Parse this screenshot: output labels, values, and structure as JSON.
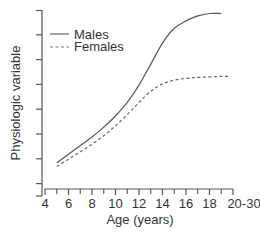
{
  "chart_data": {
    "type": "line",
    "title": "",
    "xlabel": "Age (years)",
    "ylabel": "Physiologic variable",
    "x_ticks": [
      "4",
      "6",
      "8",
      "10",
      "12",
      "14",
      "16",
      "18",
      "20-30"
    ],
    "x_tick_positions": [
      4,
      6,
      8,
      10,
      12,
      14,
      16,
      18,
      20
    ],
    "x_minor_ticks": [
      5,
      7,
      9,
      11,
      13,
      15,
      17,
      19
    ],
    "y_ticks_count": 8,
    "y_tick_labels": [],
    "xlim": [
      4,
      20
    ],
    "ylim": [
      0,
      7.5
    ],
    "grid": false,
    "legend_position": "upper-left",
    "series": [
      {
        "name": "Males",
        "style": "solid",
        "color": "#555555",
        "points": [
          [
            5,
            1.3
          ],
          [
            6,
            1.65
          ],
          [
            7,
            2.0
          ],
          [
            8,
            2.35
          ],
          [
            9,
            2.75
          ],
          [
            10,
            3.2
          ],
          [
            11,
            3.75
          ],
          [
            12,
            4.45
          ],
          [
            13,
            5.3
          ],
          [
            14,
            6.15
          ],
          [
            15,
            6.75
          ],
          [
            16,
            7.05
          ],
          [
            17,
            7.25
          ],
          [
            18,
            7.35
          ],
          [
            19,
            7.35
          ]
        ]
      },
      {
        "name": "Females",
        "style": "dashed",
        "color": "#666666",
        "points": [
          [
            5,
            1.15
          ],
          [
            6,
            1.45
          ],
          [
            7,
            1.75
          ],
          [
            8,
            2.05
          ],
          [
            9,
            2.4
          ],
          [
            10,
            2.8
          ],
          [
            11,
            3.25
          ],
          [
            12,
            3.75
          ],
          [
            13,
            4.2
          ],
          [
            14,
            4.5
          ],
          [
            15,
            4.65
          ],
          [
            16,
            4.72
          ],
          [
            17,
            4.76
          ],
          [
            18,
            4.78
          ],
          [
            19,
            4.8
          ],
          [
            19.6,
            4.8
          ]
        ]
      }
    ]
  },
  "legend": {
    "males": "Males",
    "females": "Females"
  },
  "axes": {
    "x_label": "Age (years)",
    "y_label": "Physiologic variable"
  }
}
